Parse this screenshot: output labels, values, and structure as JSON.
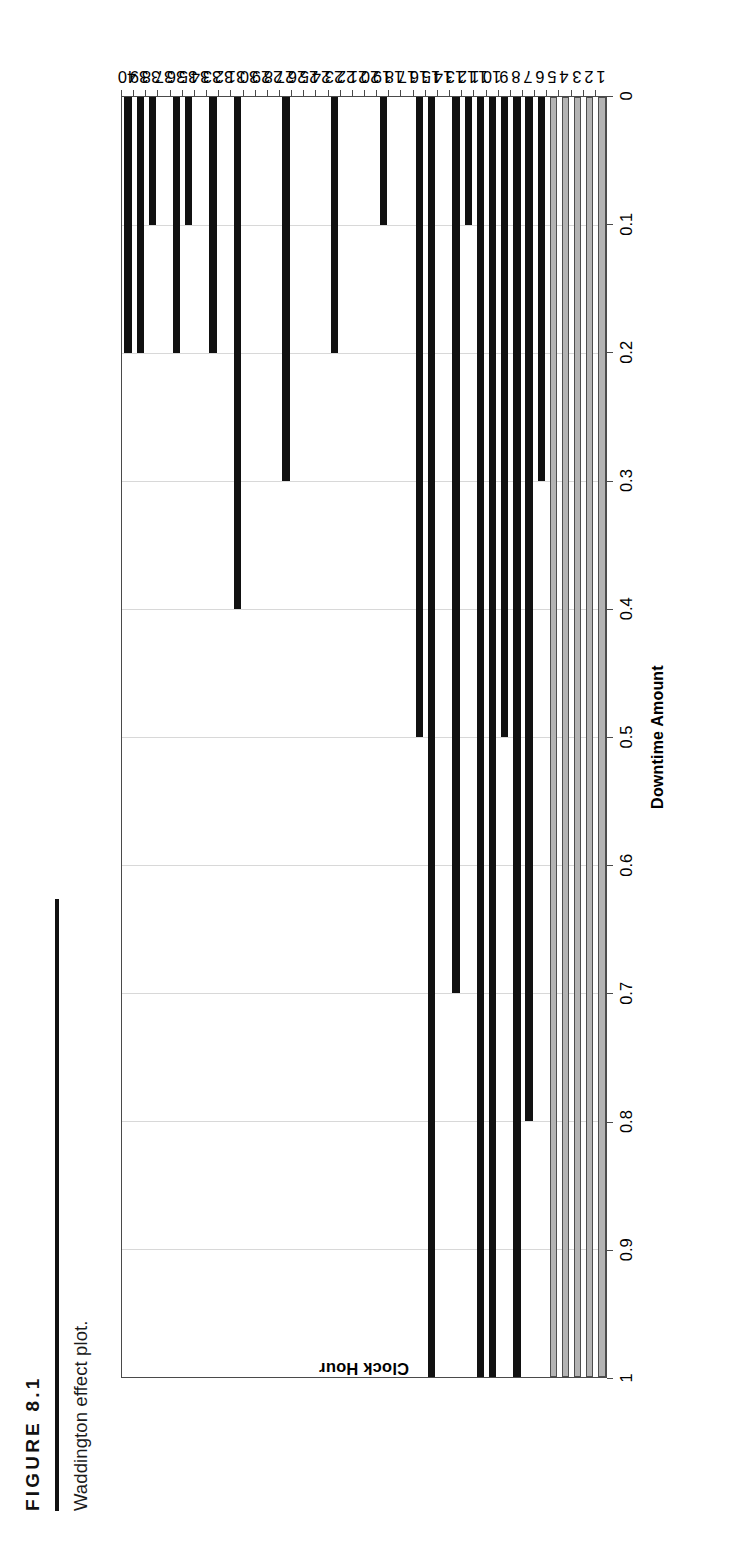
{
  "figure": {
    "label": "FIGURE 8.1",
    "caption": "Waddington effect plot."
  },
  "chart_data": {
    "type": "bar",
    "orientation": "horizontal",
    "title": "",
    "xlabel": "Clock Hour",
    "ylabel": "Downtime Amount",
    "categories": [
      "1",
      "2",
      "3",
      "4",
      "5",
      "6",
      "7",
      "8",
      "9",
      "10",
      "11",
      "12",
      "13",
      "14",
      "15",
      "16",
      "17",
      "18",
      "19",
      "20",
      "21",
      "22",
      "23",
      "24",
      "25",
      "26",
      "27",
      "28",
      "29",
      "30",
      "31",
      "32",
      "33",
      "34",
      "35",
      "36",
      "37",
      "38",
      "39",
      "40"
    ],
    "values": [
      1,
      1,
      1,
      1,
      1,
      0.3,
      0.8,
      1,
      0.5,
      1,
      1,
      0.1,
      0.7,
      0,
      1,
      0.5,
      0,
      0,
      0.1,
      0,
      0,
      0,
      0.2,
      0,
      0,
      0,
      0.3,
      0,
      0,
      0,
      0.4,
      0,
      0.2,
      0,
      0.1,
      0.2,
      0,
      0.1,
      0.2,
      0.2
    ],
    "bar_colors": [
      "gray",
      "gray",
      "gray",
      "gray",
      "gray",
      "dark",
      "dark",
      "dark",
      "dark",
      "dark",
      "dark",
      "dark",
      "dark",
      "dark",
      "dark",
      "dark",
      "dark",
      "dark",
      "dark",
      "dark",
      "dark",
      "dark",
      "dark",
      "dark",
      "dark",
      "dark",
      "dark",
      "dark",
      "dark",
      "dark",
      "dark",
      "dark",
      "dark",
      "dark",
      "dark",
      "dark",
      "dark",
      "dark",
      "dark",
      "dark"
    ],
    "value_axis_ticks": [
      "1",
      "0.9",
      "0.8",
      "0.7",
      "0.6",
      "0.5",
      "0.4",
      "0.3",
      "0.2",
      "0.1",
      "0"
    ],
    "value_axis_tick_values": [
      1,
      0.9,
      0.8,
      0.7,
      0.6,
      0.5,
      0.4,
      0.3,
      0.2,
      0.1,
      0
    ],
    "ylim": [
      0,
      1
    ],
    "grid": true,
    "legend": "none",
    "colors": {
      "dark_bar": "#111111",
      "gray_bar": "#b3b3b3",
      "gray_bar_outline": "#4d4d4d",
      "gridline": "#d8d8d8",
      "axis": "#4a4a4a",
      "background": "#ffffff",
      "text": "#000000"
    }
  }
}
